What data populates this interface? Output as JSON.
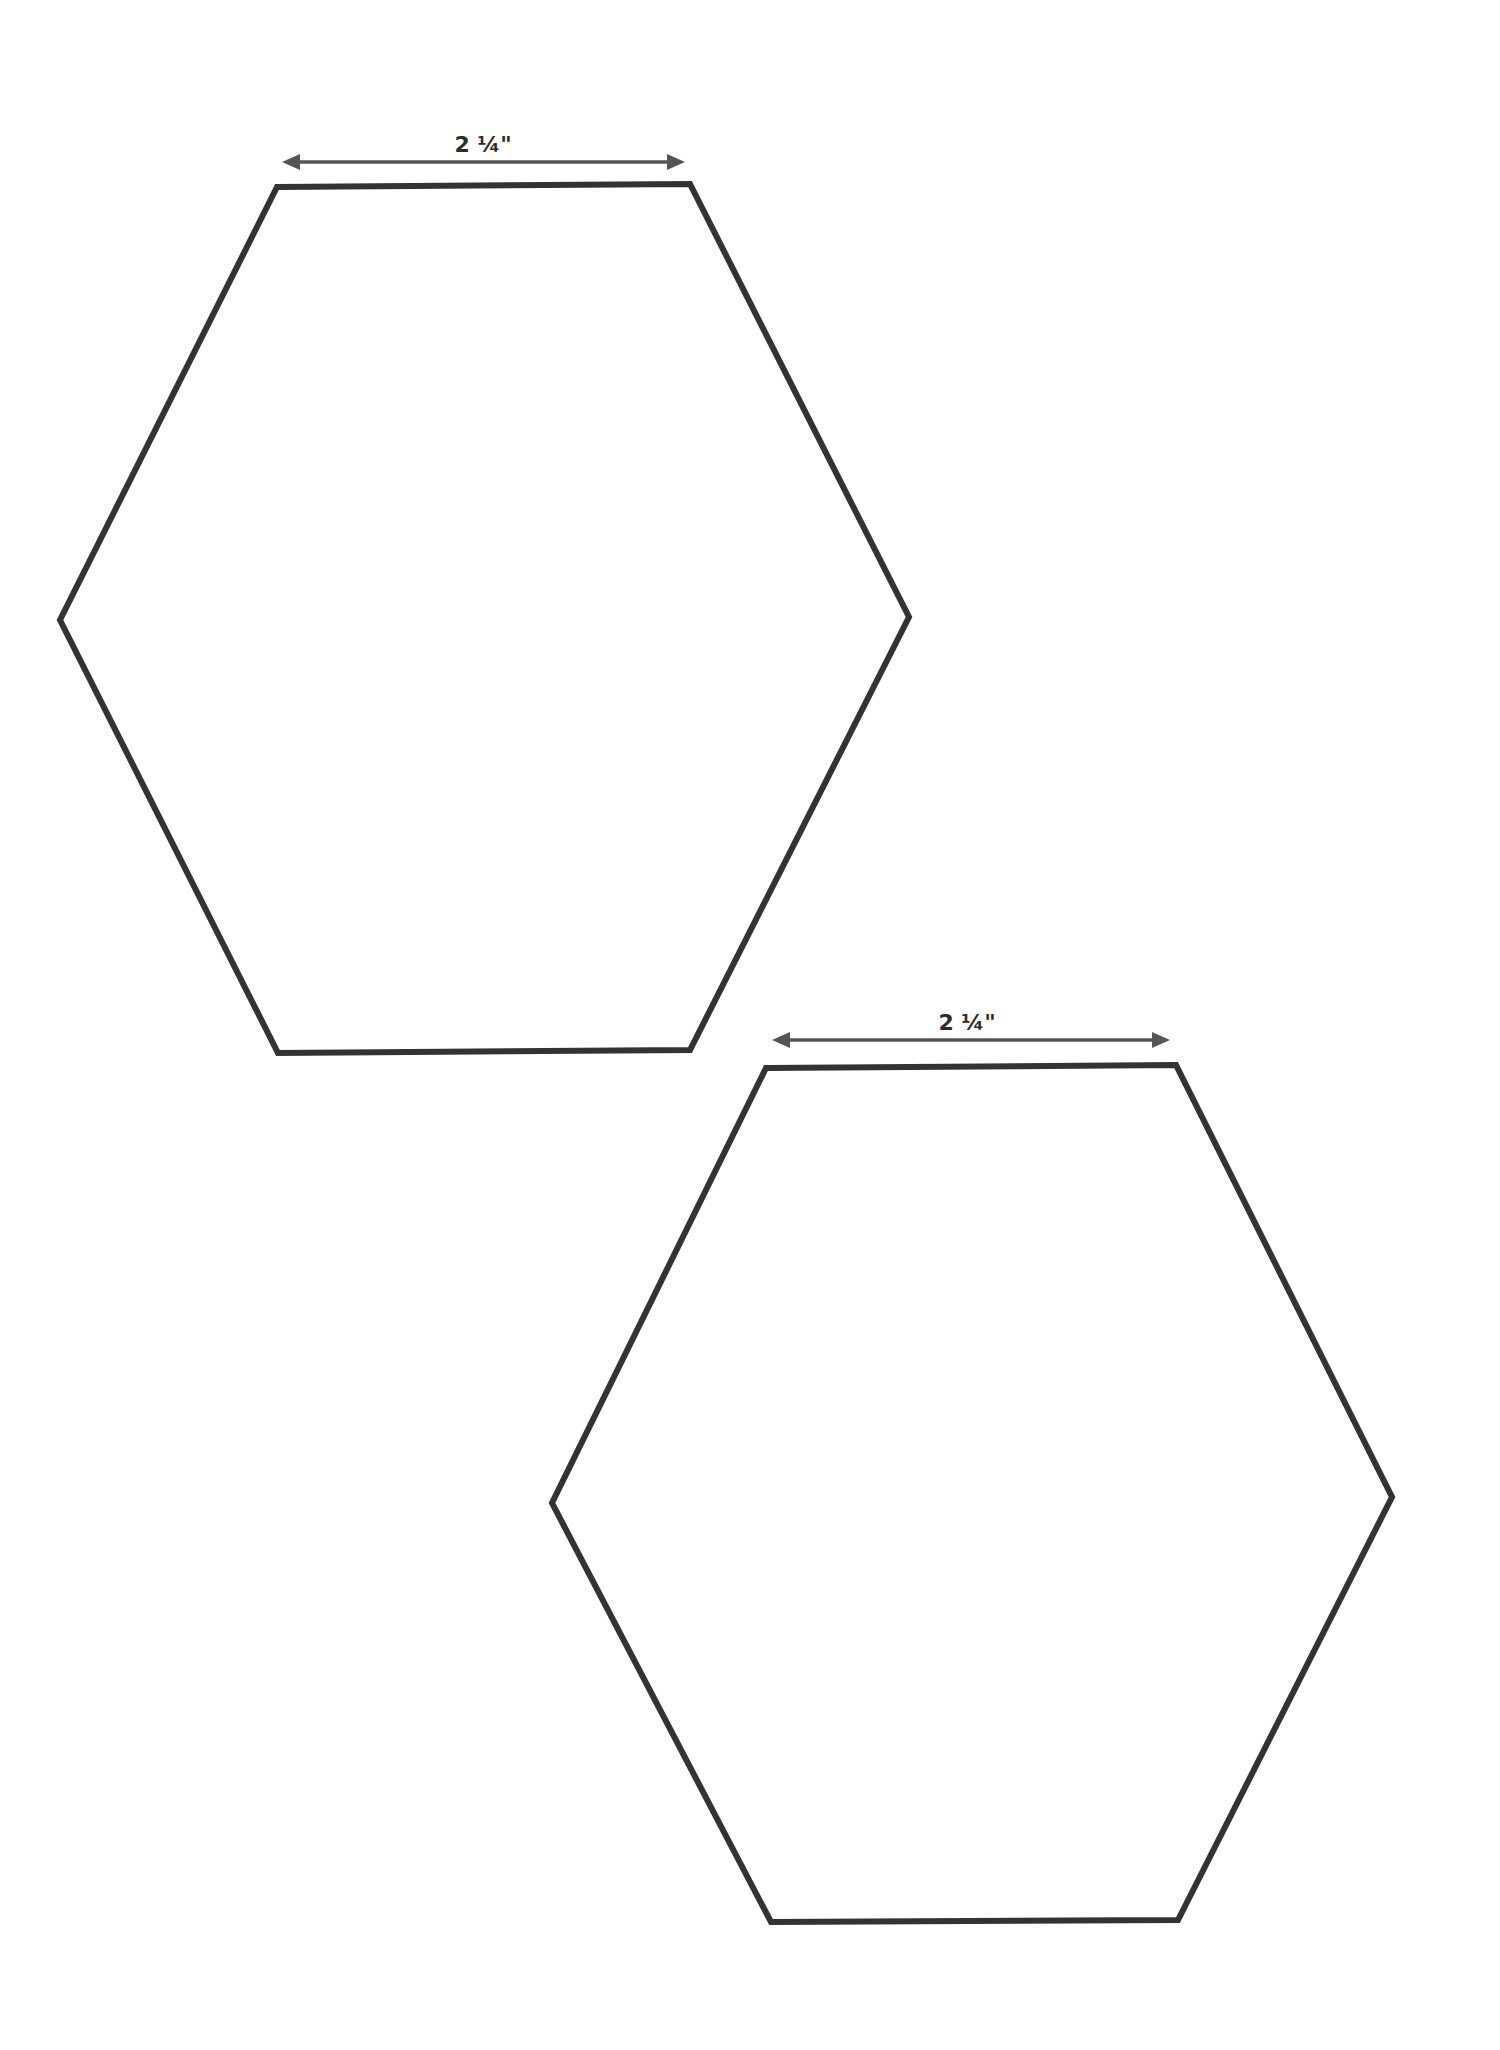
{
  "page": {
    "type": "hexagon-template",
    "background": "#ffffff",
    "stroke_color": "#333333",
    "dimension_color": "#555555"
  },
  "shapes": [
    {
      "name": "hexagon-1",
      "dimension_label": "2 ¼\"",
      "points": [
        [
          277,
          187
        ],
        [
          690,
          184
        ],
        [
          909,
          617
        ],
        [
          690,
          1050
        ],
        [
          278,
          1053
        ],
        [
          60,
          620
        ]
      ],
      "dimension_line": {
        "x1": 282,
        "x2": 685,
        "y": 162,
        "label_x": 483,
        "label_y": 152
      }
    },
    {
      "name": "hexagon-2",
      "dimension_label": "2 ¼\"",
      "points": [
        [
          766,
          1068
        ],
        [
          1176,
          1065
        ],
        [
          1392,
          1497
        ],
        [
          1178,
          1920
        ],
        [
          771,
          1922
        ],
        [
          552,
          1503
        ]
      ],
      "dimension_line": {
        "x1": 772,
        "x2": 1170,
        "y": 1040,
        "label_x": 967,
        "label_y": 1030
      }
    }
  ]
}
